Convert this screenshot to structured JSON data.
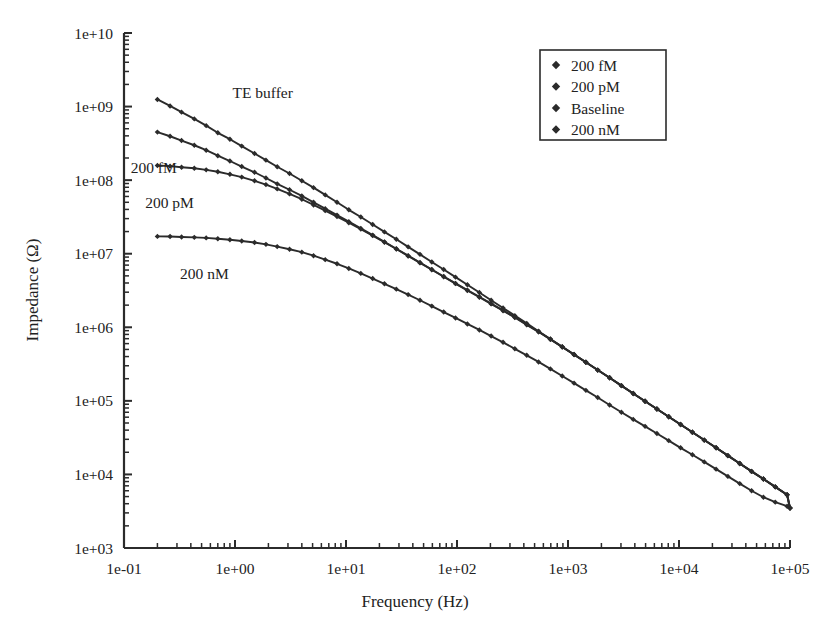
{
  "chart_data": {
    "type": "line",
    "title": "",
    "xlabel": "Frequency (Hz)",
    "ylabel": "Impedance (Ω)",
    "xscale": "log",
    "yscale": "log",
    "xlim": [
      0.1,
      100000
    ],
    "ylim": [
      1000,
      10000000000
    ],
    "xticklabels": [
      "1e-01",
      "1e+00",
      "1e+01",
      "1e+02",
      "1e+03",
      "1e+04",
      "1e+05"
    ],
    "xtickvalues": [
      0.1,
      1,
      10,
      100,
      1000,
      10000,
      100000
    ],
    "yticklabels": [
      "1e+03",
      "1e+04",
      "1e+05",
      "1e+06",
      "1e+07",
      "1e+08",
      "1e+09",
      "1e+10"
    ],
    "ytickvalues": [
      1000,
      10000,
      100000,
      1000000,
      10000000,
      100000000,
      1000000000,
      10000000000
    ],
    "grid": false,
    "minor_ticks": true,
    "marker": "diamond",
    "line_color": "#2b2b2b",
    "legend_position": "top-right",
    "legend_entries": [
      "200 fM",
      "200 pM",
      "Baseline",
      "200 nM"
    ],
    "annotations": [
      {
        "text": "TE buffer",
        "x": 0.95,
        "y": 1300000000.0
      },
      {
        "text": "200 fM",
        "x": 0.115,
        "y": 125000000.0
      },
      {
        "text": "200 pM",
        "x": 0.155,
        "y": 42000000.0
      },
      {
        "text": "200 nM",
        "x": 0.32,
        "y": 4600000.0
      }
    ],
    "series": [
      {
        "name": "Baseline",
        "label_on_plot": "TE buffer",
        "x": [
          0.2,
          0.26,
          0.33,
          0.43,
          0.55,
          0.7,
          0.9,
          1.15,
          1.5,
          1.9,
          2.4,
          3.1,
          4.0,
          5.1,
          6.5,
          8.3,
          10.6,
          13.6,
          17.4,
          22.2,
          28.4,
          36.3,
          46.4,
          59.3,
          75.9,
          97.0,
          124,
          159,
          203,
          260,
          332,
          425,
          543,
          694,
          887,
          1134,
          1450,
          1853,
          2369,
          3028,
          3871,
          4948,
          6325,
          8085,
          10335,
          13211,
          16885,
          21583,
          27589,
          35265,
          45080,
          57620,
          73650,
          94140,
          100000
        ],
        "y": [
          1250000000.0,
          1020000000.0,
          840000000.0,
          680000000.0,
          550000000.0,
          440000000.0,
          360000000.0,
          290000000.0,
          230000000.0,
          187000000.0,
          152000000.0,
          123000000.0,
          98000000.0,
          79000000.0,
          63000000.0,
          50000000.0,
          39500000.0,
          31500000.0,
          25000000.0,
          19800000.0,
          15700000.0,
          12400000.0,
          9800000.0,
          7700000.0,
          6100000.0,
          4800000.0,
          3780000.0,
          2970000.0,
          2330000.0,
          1830000.0,
          1440000.0,
          1130000.0,
          885000.0,
          694000.0,
          544000.0,
          427000.0,
          335000.0,
          262000.0,
          206000.0,
          161000.0,
          126000.0,
          99000.0,
          77600.0,
          60800.0,
          47700.0,
          37400.0,
          29300.0,
          23000.0,
          18000.0,
          14100.0,
          11000.0,
          8650.0,
          6780.0,
          5300.0,
          3500.0
        ]
      },
      {
        "name": "200 fM",
        "label_on_plot": "200 fM",
        "x": [
          0.2,
          0.26,
          0.33,
          0.43,
          0.55,
          0.7,
          0.9,
          1.15,
          1.5,
          1.9,
          2.4,
          3.1,
          4.0,
          5.1,
          6.5,
          8.3,
          10.6,
          13.6,
          17.4,
          22.2,
          28.4,
          36.3,
          46.4,
          59.3,
          75.9,
          97.0,
          124,
          159,
          203,
          260,
          332,
          425,
          543,
          694,
          887,
          1134,
          1450,
          1853,
          2369,
          3028,
          3871,
          4948,
          6325,
          8085,
          10335,
          13211,
          16885,
          21583,
          27589,
          35265,
          45080,
          57620,
          73650,
          94140,
          100000
        ],
        "y": [
          450000000.0,
          395000000.0,
          345000000.0,
          298000000.0,
          255000000.0,
          215000000.0,
          182000000.0,
          153000000.0,
          128000000.0,
          107000000.0,
          89000000.0,
          74000000.0,
          61000000.0,
          50000000.0,
          41000000.0,
          33500000.0,
          27300000.0,
          22100000.0,
          17900000.0,
          14500000.0,
          11700000.0,
          9400000.0,
          7600000.0,
          6100000.0,
          4900000.0,
          3950000.0,
          3200000.0,
          2600000.0,
          2100000.0,
          1700000.0,
          1370000.0,
          1090000.0,
          870000.0,
          688000.0,
          542000.0,
          426000.0,
          334000.0,
          262000.0,
          206000.0,
          161000.0,
          126000.0,
          99000.0,
          77600.0,
          60800.0,
          47700.0,
          37400.0,
          29300.0,
          23000.0,
          18000.0,
          14100.0,
          11000.0,
          8650.0,
          6780.0,
          5300.0,
          3500.0
        ]
      },
      {
        "name": "200 pM",
        "label_on_plot": "200 pM",
        "x": [
          0.2,
          0.26,
          0.33,
          0.43,
          0.55,
          0.7,
          0.9,
          1.15,
          1.5,
          1.9,
          2.4,
          3.1,
          4.0,
          5.1,
          6.5,
          8.3,
          10.6,
          13.6,
          17.4,
          22.2,
          28.4,
          36.3,
          46.4,
          59.3,
          75.9,
          97.0,
          124,
          159,
          203,
          260,
          332,
          425,
          543,
          694,
          887,
          1134,
          1450,
          1853,
          2369,
          3028,
          3871,
          4948,
          6325,
          8085,
          10335,
          13211,
          16885,
          21583,
          27589,
          35265,
          45080,
          57620,
          73650,
          94140,
          100000
        ],
        "y": [
          158000000.0,
          155000000.0,
          150000000.0,
          145000000.0,
          138000000.0,
          130000000.0,
          120000000.0,
          110000000.0,
          98000000.0,
          87000000.0,
          76000000.0,
          65000000.0,
          55000000.0,
          46000000.0,
          38500000.0,
          32000000.0,
          26400000.0,
          21600000.0,
          17600000.0,
          14300000.0,
          11600000.0,
          9300000.0,
          7500000.0,
          6050000.0,
          4860000.0,
          3920000.0,
          3160000.0,
          2560000.0,
          2080000.0,
          1680000.0,
          1360000.0,
          1080000.0,
          868000.0,
          686000.0,
          540000.0,
          425000.0,
          334000.0,
          262000.0,
          206000.0,
          161000.0,
          126000.0,
          99000.0,
          77600.0,
          60800.0,
          47700.0,
          37400.0,
          29300.0,
          23000.0,
          18000.0,
          14100.0,
          11000.0,
          8650.0,
          6780.0,
          5300.0,
          3500.0
        ]
      },
      {
        "name": "200 nM",
        "label_on_plot": "200 nM",
        "x": [
          0.2,
          0.26,
          0.33,
          0.43,
          0.55,
          0.7,
          0.9,
          1.15,
          1.5,
          1.9,
          2.4,
          3.1,
          4.0,
          5.1,
          6.5,
          8.3,
          10.6,
          13.6,
          17.4,
          22.2,
          28.4,
          36.3,
          46.4,
          59.3,
          75.9,
          97.0,
          124,
          159,
          203,
          260,
          332,
          425,
          543,
          694,
          887,
          1134,
          1450,
          1853,
          2369,
          3028,
          3871,
          4948,
          6325,
          8085,
          10335,
          13211,
          16885,
          21583,
          27589,
          35265,
          45080,
          57620,
          73650,
          94140,
          100000
        ],
        "y": [
          17200000.0,
          17100000.0,
          16900000.0,
          16700000.0,
          16400000.0,
          16000000.0,
          15500000.0,
          14900000.0,
          14200000.0,
          13400000.0,
          12500000.0,
          11500000.0,
          10500000.0,
          9400000.0,
          8300000.0,
          7300000.0,
          6300000.0,
          5400000.0,
          4600000.0,
          3900000.0,
          3300000.0,
          2780000.0,
          2330000.0,
          1940000.0,
          1610000.0,
          1340000.0,
          1110000.0,
          920000.0,
          760000.0,
          625000.0,
          510000.0,
          416000.0,
          338000.0,
          272000.0,
          218000.0,
          174000.0,
          139000.0,
          111000.0,
          88000.0,
          70000.0,
          56000.0,
          45000.0,
          36000.0,
          28800.0,
          23000.0,
          18500.0,
          14800.0,
          11800.0,
          9400.0,
          7500.0,
          6000.0,
          4900.0,
          4200.0,
          3700.0,
          3500.0
        ]
      }
    ]
  },
  "axes": {
    "xlabel": "Frequency (Hz)",
    "ylabel": "Impedance (Ω)"
  },
  "legend": {
    "items": [
      {
        "label": "200 fM"
      },
      {
        "label": "200 pM"
      },
      {
        "label": "Baseline"
      },
      {
        "label": "200 nM"
      }
    ]
  }
}
